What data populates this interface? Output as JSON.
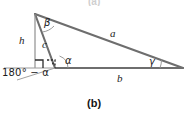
{
  "figure": {
    "caption": "(b)",
    "geometry": {
      "apex": [
        35,
        14
      ],
      "base_left": [
        55,
        68
      ],
      "base_right": [
        183,
        68
      ],
      "foot_of_height": [
        35,
        68
      ],
      "extension_left": [
        4,
        68
      ]
    },
    "labels": {
      "side_a": "a",
      "side_b": "b",
      "side_c": "c",
      "height_h": "h",
      "angle_alpha": "α",
      "angle_beta": "β",
      "angle_gamma": "γ",
      "exterior_angle": "180° − α"
    },
    "markers": {
      "right_angle_solid": "right-angle-square",
      "right_angle_dashed": "right-angle-square-dashed"
    },
    "colors": {
      "stroke_main": "#6e6e6e",
      "stroke_thin": "#8f8f8f",
      "text": "#1b1b1b",
      "background": "#ffffff"
    }
  },
  "top_fragment": {
    "text": "(a)"
  }
}
